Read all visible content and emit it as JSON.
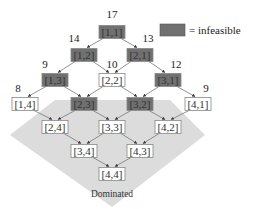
{
  "legend": {
    "label": "= infeasible",
    "swatch_color": "#707070"
  },
  "region": {
    "label": "Dominated",
    "color": "#dcdcdc"
  },
  "colors": {
    "infeasible_fill": "#707070",
    "feasible_fill": "#ffffff",
    "edge": "#777777",
    "border": "#888888"
  },
  "nodes": [
    {
      "id": "1,1",
      "label": "[1,1]",
      "x": 112,
      "y": 32,
      "infeasible": true,
      "score": "17",
      "score_dx": 0,
      "score_dy": -14
    },
    {
      "id": "1,2",
      "label": "[1,2]",
      "x": 84,
      "y": 55,
      "infeasible": true,
      "score": "14",
      "score_dx": -10,
      "score_dy": -13
    },
    {
      "id": "2,1",
      "label": "[2,1]",
      "x": 140,
      "y": 55,
      "infeasible": true,
      "score": "13",
      "score_dx": 8,
      "score_dy": -13
    },
    {
      "id": "1,3",
      "label": "[1,3]",
      "x": 55,
      "y": 80,
      "infeasible": true,
      "score": "9",
      "score_dx": -10,
      "score_dy": -12
    },
    {
      "id": "2,2",
      "label": "[2,2]",
      "x": 112,
      "y": 80,
      "infeasible": false,
      "score": "10",
      "score_dx": 0,
      "score_dy": -12
    },
    {
      "id": "3,1",
      "label": "[3,1]",
      "x": 168,
      "y": 80,
      "infeasible": true,
      "score": "12",
      "score_dx": 8,
      "score_dy": -12
    },
    {
      "id": "1,4",
      "label": "[1,4]",
      "x": 25,
      "y": 104,
      "infeasible": false,
      "score": "8",
      "score_dx": -7,
      "score_dy": -12
    },
    {
      "id": "2,3",
      "label": "[2,3]",
      "x": 84,
      "y": 104,
      "infeasible": true,
      "score": "",
      "score_dx": 0,
      "score_dy": 0
    },
    {
      "id": "3,2",
      "label": "[3,2]",
      "x": 140,
      "y": 104,
      "infeasible": true,
      "score": "",
      "score_dx": 0,
      "score_dy": 0
    },
    {
      "id": "4,1",
      "label": "[4,1]",
      "x": 198,
      "y": 104,
      "infeasible": false,
      "score": "9",
      "score_dx": 8,
      "score_dy": -12
    },
    {
      "id": "2,4",
      "label": "[2,4]",
      "x": 55,
      "y": 127,
      "infeasible": false,
      "score": "",
      "score_dx": 0,
      "score_dy": 0
    },
    {
      "id": "3,3",
      "label": "[3,3]",
      "x": 112,
      "y": 127,
      "infeasible": false,
      "score": "",
      "score_dx": 0,
      "score_dy": 0
    },
    {
      "id": "4,2",
      "label": "[4,2]",
      "x": 168,
      "y": 127,
      "infeasible": false,
      "score": "",
      "score_dx": 0,
      "score_dy": 0
    },
    {
      "id": "3,4",
      "label": "[3,4]",
      "x": 84,
      "y": 151,
      "infeasible": false,
      "score": "",
      "score_dx": 0,
      "score_dy": 0
    },
    {
      "id": "4,3",
      "label": "[4,3]",
      "x": 140,
      "y": 151,
      "infeasible": false,
      "score": "",
      "score_dx": 0,
      "score_dy": 0
    },
    {
      "id": "4,4",
      "label": "[4,4]",
      "x": 112,
      "y": 174,
      "infeasible": false,
      "score": "",
      "score_dx": 0,
      "score_dy": 0
    }
  ],
  "edges": [
    [
      "1,1",
      "1,2"
    ],
    [
      "1,1",
      "2,1"
    ],
    [
      "1,2",
      "1,3"
    ],
    [
      "1,2",
      "2,2"
    ],
    [
      "2,1",
      "2,2"
    ],
    [
      "2,1",
      "3,1"
    ],
    [
      "1,3",
      "1,4"
    ],
    [
      "1,3",
      "2,3"
    ],
    [
      "2,2",
      "2,3"
    ],
    [
      "2,2",
      "3,2"
    ],
    [
      "3,1",
      "3,2"
    ],
    [
      "3,1",
      "4,1"
    ],
    [
      "1,4",
      "2,4"
    ],
    [
      "2,3",
      "2,4"
    ],
    [
      "2,3",
      "3,3"
    ],
    [
      "3,2",
      "3,3"
    ],
    [
      "3,2",
      "4,2"
    ],
    [
      "4,1",
      "4,2"
    ],
    [
      "2,4",
      "3,4"
    ],
    [
      "3,3",
      "3,4"
    ],
    [
      "3,3",
      "4,3"
    ],
    [
      "4,2",
      "4,3"
    ],
    [
      "3,4",
      "4,4"
    ],
    [
      "4,3",
      "4,4"
    ]
  ]
}
